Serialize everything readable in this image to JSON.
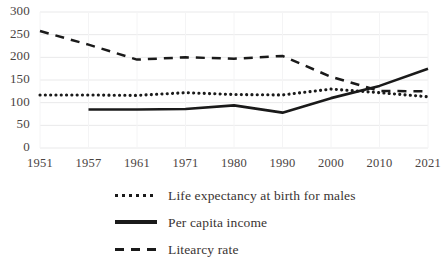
{
  "chart_data": {
    "type": "line",
    "title": "",
    "xlabel": "",
    "ylabel": "",
    "categories": [
      "1951",
      "1957",
      "1961",
      "1971",
      "1980",
      "1990",
      "2000",
      "2010",
      "2021"
    ],
    "ylim": [
      0,
      300
    ],
    "yticks": [
      0,
      50,
      100,
      150,
      200,
      250,
      300
    ],
    "grid": true,
    "legend_position": "bottom",
    "series": [
      {
        "name": "Life expectancy at birth for males",
        "style": "dotted",
        "color": "#1a1a1a",
        "values": [
          117,
          117,
          116,
          122,
          118,
          117,
          130,
          122,
          113
        ]
      },
      {
        "name": "Per capita income",
        "style": "solid",
        "color": "#1a1a1a",
        "values": [
          null,
          85,
          85,
          86,
          94,
          78,
          110,
          137,
          175
        ]
      },
      {
        "name": "Litearcy rate",
        "style": "dashed",
        "color": "#1a1a1a",
        "values": [
          258,
          228,
          195,
          200,
          197,
          203,
          157,
          126,
          125
        ]
      }
    ]
  },
  "axis": {
    "ytick_labels": [
      "300",
      "250",
      "200",
      "150",
      "100",
      "50",
      "0"
    ],
    "xtick_labels": [
      "1951",
      "1957",
      "1961",
      "1971",
      "1980",
      "1990",
      "2000",
      "2010",
      "2021"
    ]
  },
  "legend": {
    "items": [
      {
        "label": "Life expectancy at birth for males",
        "style": "dotted"
      },
      {
        "label": "Per capita income",
        "style": "solid"
      },
      {
        "label": "Litearcy rate",
        "style": "dashed"
      }
    ]
  },
  "colors": {
    "series": "#1a1a1a",
    "grid": "#e9e9ea",
    "text": "#4a4442",
    "background": "#ffffff"
  }
}
